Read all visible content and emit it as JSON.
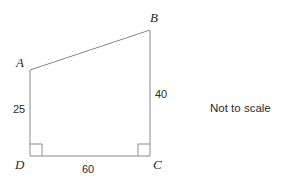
{
  "figure": {
    "type": "quadrilateral",
    "name": "ABCD",
    "stroke_color": "#8a8a8a",
    "text_color": "#2b2b2b",
    "background_color": "#ffffff",
    "vertices": [
      {
        "id": "A",
        "label": "A",
        "x": 30,
        "y": 70
      },
      {
        "id": "B",
        "label": "B",
        "x": 150,
        "y": 30
      },
      {
        "id": "C",
        "label": "C",
        "x": 150,
        "y": 156
      },
      {
        "id": "D",
        "label": "D",
        "x": 30,
        "y": 156
      }
    ],
    "edges": [
      {
        "id": "AB",
        "from": "A",
        "to": "B",
        "length_label": ""
      },
      {
        "id": "BC",
        "from": "B",
        "to": "C",
        "length_label": "40"
      },
      {
        "id": "CD",
        "from": "C",
        "to": "D",
        "length_label": "60"
      },
      {
        "id": "DA",
        "from": "D",
        "to": "A",
        "length_label": "25"
      }
    ],
    "side_labels": {
      "DA": "25",
      "BC": "40",
      "DC": "60"
    },
    "right_angles": [
      {
        "at": "D",
        "size": 12
      },
      {
        "at": "C",
        "size": 12
      }
    ],
    "note": "Not to scale"
  }
}
